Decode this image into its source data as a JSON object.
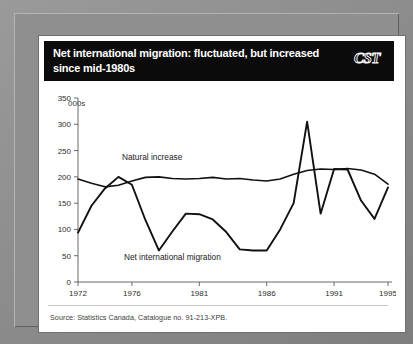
{
  "figure": {
    "title": "Net international migration: fluctuated, but increased since mid-1980s",
    "title_line1": "Net international migration: fluctuated, but increased",
    "title_line2": "since mid-1980s",
    "logo_text": "CST",
    "logo_name": "cst-logo",
    "source": "Source: Statistics Canada, Catalogue no. 91-213-XPB.",
    "unit_label": "000s",
    "title_bar_color": "#0b0b0b",
    "title_text_color": "#ffffff",
    "panel_color": "#ffffff",
    "frame_color": "#8f8f8f",
    "line_color": "#111111"
  },
  "chart_data": {
    "type": "line",
    "title": "Net international migration: fluctuated, but increased since mid-1980s",
    "subtitle": "",
    "xlabel": "",
    "ylabel": "000s",
    "unit": "thousands",
    "xlim": [
      1972,
      1995
    ],
    "ylim": [
      0,
      350
    ],
    "ytick_step": 50,
    "yticks": [
      0,
      50,
      100,
      150,
      200,
      250,
      300,
      350
    ],
    "xticks": [
      1972,
      1976,
      1981,
      1986,
      1991,
      1995
    ],
    "xtick_labels": [
      "1972",
      "1976",
      "1981",
      "1986",
      "1991",
      "1995"
    ],
    "grid": false,
    "legend": "inline-annotations",
    "annotations": [
      {
        "text": "Natural increase",
        "x": 1977.5,
        "y": 232
      },
      {
        "text": "Net international migration",
        "x": 1979.0,
        "y": 42
      }
    ],
    "x": [
      1972,
      1973,
      1974,
      1975,
      1976,
      1977,
      1978,
      1979,
      1980,
      1981,
      1982,
      1983,
      1984,
      1985,
      1986,
      1987,
      1988,
      1989,
      1990,
      1991,
      1992,
      1993,
      1994,
      1995
    ],
    "series": [
      {
        "name": "Natural increase",
        "values": [
          196,
          188,
          181,
          184,
          192,
          199,
          200,
          197,
          196,
          197,
          199,
          196,
          197,
          194,
          192,
          196,
          205,
          212,
          215,
          214,
          216,
          213,
          205,
          186
        ]
      },
      {
        "name": "Net international migration",
        "values": [
          94,
          145,
          178,
          200,
          185,
          118,
          60,
          96,
          130,
          129,
          119,
          95,
          62,
          60,
          60,
          100,
          150,
          305,
          130,
          215,
          214,
          155,
          120,
          180
        ]
      }
    ]
  }
}
